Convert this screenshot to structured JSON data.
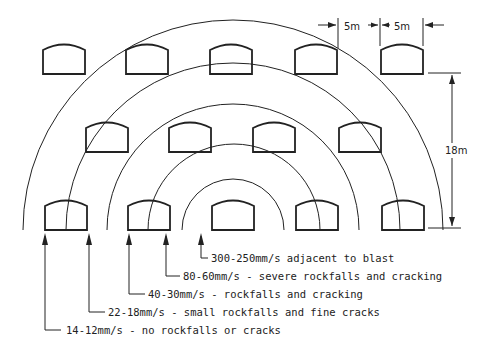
{
  "diagram": {
    "dimensions": {
      "spacing_label_1": "5m",
      "spacing_label_2": "5m",
      "height_label": "18m"
    },
    "zones": [
      {
        "label": "300-250mm/s adjacent to blast"
      },
      {
        "label": "80-60mm/s - severe rockfalls and cracking"
      },
      {
        "label": "40-30mm/s - rockfalls and cracking"
      },
      {
        "label": "22-18mm/s - small rockfalls and fine cracks"
      },
      {
        "label": "14-12mm/s - no rockfalls or cracks"
      }
    ],
    "tunnel_rows": [
      {
        "row": 1,
        "count": 5
      },
      {
        "row": 2,
        "count": 4
      },
      {
        "row": 3,
        "count": 5
      }
    ],
    "colors": {
      "line": "#222222",
      "background": "#ffffff"
    }
  }
}
